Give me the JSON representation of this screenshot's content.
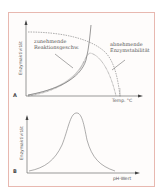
{
  "panel_a": {
    "label": "A",
    "y_axis_label": "Enzymaktivität",
    "x_axis_label": "Temp. °C",
    "annotations": {
      "increasing_rate_line1": "zunehmende",
      "increasing_rate_line2": "Reaktionsgeschw.",
      "decreasing_stability_line1": "abnehmende",
      "decreasing_stability_line2": "Enzymstabilität"
    }
  },
  "panel_b": {
    "label": "B",
    "y_axis_label": "Enzymaktivität",
    "x_axis_label": "pH-Wert"
  },
  "colors": {
    "frame": "#e8b8b0",
    "line": "#666666"
  }
}
